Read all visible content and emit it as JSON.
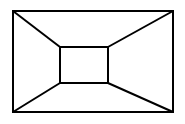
{
  "diagram": {
    "stroke_color": "#000000",
    "background_color": "#ffffff",
    "outer_rect": {
      "x1": 13,
      "y1": 11,
      "x2": 173,
      "y2": 112
    },
    "inner_rect": {
      "x1": 60,
      "y1": 47,
      "x2": 108,
      "y2": 83
    },
    "connectors": [
      {
        "from": [
          13,
          11
        ],
        "to": [
          60,
          47
        ]
      },
      {
        "from": [
          173,
          11
        ],
        "to": [
          108,
          47
        ]
      },
      {
        "from": [
          13,
          112
        ],
        "to": [
          60,
          83
        ]
      },
      {
        "from": [
          173,
          112
        ],
        "to": [
          108,
          83
        ]
      }
    ]
  }
}
